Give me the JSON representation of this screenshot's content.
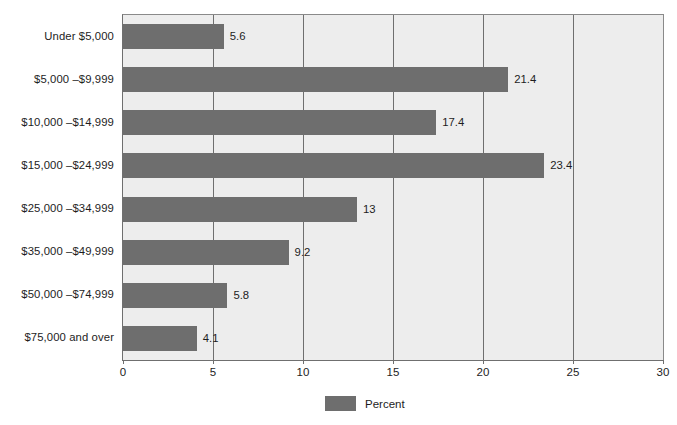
{
  "chart_data": {
    "type": "bar",
    "orientation": "horizontal",
    "title": "",
    "xlabel": "",
    "ylabel": "",
    "categories": [
      "Under $5,000",
      "$5,000 –$9,999",
      "$10,000 –$14,999",
      "$15,000 –$24,999",
      "$25,000 –$34,999",
      "$35,000 –$49,999",
      "$50,000 –$74,999",
      "$75,000 and over"
    ],
    "values": [
      5.6,
      21.4,
      17.4,
      23.4,
      13,
      9.2,
      5.8,
      4.1
    ],
    "value_labels": [
      "5.6",
      "21.4",
      "17.4",
      "23.4",
      "13",
      "9.2",
      "5.8",
      "4.1"
    ],
    "series": [
      {
        "name": "Percent",
        "values": [
          5.6,
          21.4,
          17.4,
          23.4,
          13,
          9.2,
          5.8,
          4.1
        ],
        "color": "#6e6e6e"
      }
    ],
    "xlim": [
      0,
      30
    ],
    "xticks": [
      0,
      5,
      10,
      15,
      20,
      25,
      30
    ],
    "xtick_labels": [
      "0",
      "5",
      "10",
      "15",
      "20",
      "25",
      "30"
    ],
    "grid": true,
    "grid_axis": "x",
    "legend": {
      "position": "bottom-center",
      "entries": [
        {
          "label": "Percent",
          "color": "#6e6e6e"
        }
      ]
    },
    "colors": {
      "bar": "#6e6e6e",
      "plot_background": "#ededed",
      "figure_background": "#ffffff",
      "gridline": "#6f6f6f",
      "axis": "#6f6f6f",
      "text": "#1d1d1d"
    }
  }
}
